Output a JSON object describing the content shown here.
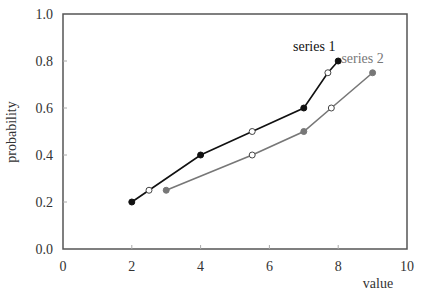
{
  "chart_data": {
    "type": "line",
    "title": "",
    "xlabel": "value",
    "ylabel": "probability",
    "xlim": [
      0,
      10
    ],
    "ylim": [
      0.0,
      1.0
    ],
    "x_ticks": [
      "0",
      "2",
      "4",
      "6",
      "8",
      "10"
    ],
    "y_ticks": [
      "0.0",
      "0.2",
      "0.4",
      "0.6",
      "0.8",
      "1.0"
    ],
    "grid": false,
    "legend": "inline labels at series ends",
    "series": [
      {
        "name": "series 1",
        "color": "#111111",
        "points": [
          {
            "x": 2.0,
            "y": 0.2,
            "marker": "filled"
          },
          {
            "x": 2.5,
            "y": 0.25,
            "marker": "open"
          },
          {
            "x": 4.0,
            "y": 0.4,
            "marker": "filled"
          },
          {
            "x": 5.5,
            "y": 0.5,
            "marker": "open"
          },
          {
            "x": 7.0,
            "y": 0.6,
            "marker": "filled"
          },
          {
            "x": 7.7,
            "y": 0.75,
            "marker": "open"
          },
          {
            "x": 8.0,
            "y": 0.8,
            "marker": "filled"
          }
        ]
      },
      {
        "name": "series 2",
        "color": "#777777",
        "points": [
          {
            "x": 3.0,
            "y": 0.25,
            "marker": "filled"
          },
          {
            "x": 5.5,
            "y": 0.4,
            "marker": "open"
          },
          {
            "x": 7.0,
            "y": 0.5,
            "marker": "filled"
          },
          {
            "x": 7.8,
            "y": 0.6,
            "marker": "open"
          },
          {
            "x": 9.0,
            "y": 0.75,
            "marker": "filled"
          }
        ]
      }
    ]
  }
}
